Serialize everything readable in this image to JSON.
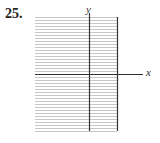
{
  "problem": {
    "number": "25."
  },
  "axes": {
    "x_label": "x",
    "y_label": "y"
  },
  "grid": {
    "left": 35,
    "right": 117,
    "top": 17,
    "bottom": 131,
    "y_axis_x": 89,
    "x_axis_y": 74,
    "x_axis_end": 143,
    "line_spacing": 3,
    "grid_color": "#b8b8b8",
    "axis_color": "#333333"
  },
  "chart_data": {
    "type": "line",
    "title": "25.",
    "xlabel": "x",
    "ylabel": "y",
    "series": [],
    "grid": true,
    "note": "Blank coordinate grid with x and y axes; no data plotted"
  }
}
